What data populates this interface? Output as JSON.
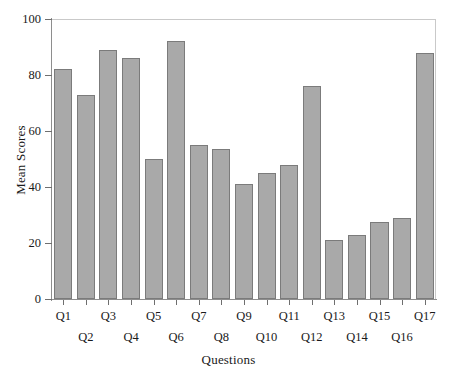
{
  "chart_data": {
    "type": "bar",
    "title": "",
    "xlabel": "Questions",
    "ylabel": "Mean Scores",
    "ylim": [
      0,
      100
    ],
    "yticks": [
      0,
      20,
      40,
      60,
      80,
      100
    ],
    "grid": false,
    "legend": "none",
    "bar_color": "#a9a9a9",
    "bar_edge_color": "#7b7b7b",
    "frame_color": "#c9c9c9",
    "axis_color": "#8e8e8e",
    "categories": [
      "Q1",
      "Q2",
      "Q3",
      "Q4",
      "Q5",
      "Q6",
      "Q7",
      "Q8",
      "Q9",
      "Q10",
      "Q11",
      "Q12",
      "Q13",
      "Q14",
      "Q15",
      "Q16",
      "Q17"
    ],
    "values": [
      82,
      73,
      89,
      86,
      50,
      92,
      55,
      53.5,
      41,
      45,
      48,
      76,
      21,
      23,
      27.5,
      29,
      88
    ]
  }
}
